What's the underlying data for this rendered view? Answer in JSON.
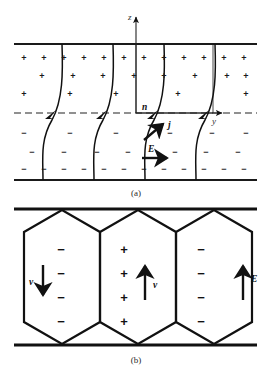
{
  "figure": {
    "title": "",
    "panels": [
      {
        "id": "a",
        "caption": "(a)",
        "description": "parallel-plate region with curved charge-separation field lines",
        "axes": {
          "vertical_label": "z",
          "horizontal_label": "y"
        },
        "vectors": [
          {
            "name": "n",
            "label": "n",
            "direction": "normal"
          },
          {
            "name": "j",
            "label": "j",
            "direction": "up-right"
          },
          {
            "name": "E",
            "label": "E",
            "direction": "right"
          }
        ],
        "charge_upper": "+",
        "charge_lower": "−",
        "field_line_count": 4
      },
      {
        "id": "b",
        "caption": "(b)",
        "description": "three hexagonal convection cells between plates",
        "cells": [
          {
            "index": 1,
            "charge": "−",
            "charge_count": 4,
            "velocity_label": "v",
            "velocity_direction": "down"
          },
          {
            "index": 2,
            "charge": "+",
            "charge_count": 4,
            "velocity_label": "v",
            "velocity_direction": "up"
          },
          {
            "index": 3,
            "charge": "−",
            "charge_count": 4,
            "velocity_label": "",
            "velocity_direction": ""
          }
        ],
        "external_field": {
          "label": "E",
          "direction": "up"
        }
      }
    ]
  },
  "colors": {
    "ink": "#111111",
    "caption": "#2b2b2b",
    "background": "#ffffff"
  }
}
